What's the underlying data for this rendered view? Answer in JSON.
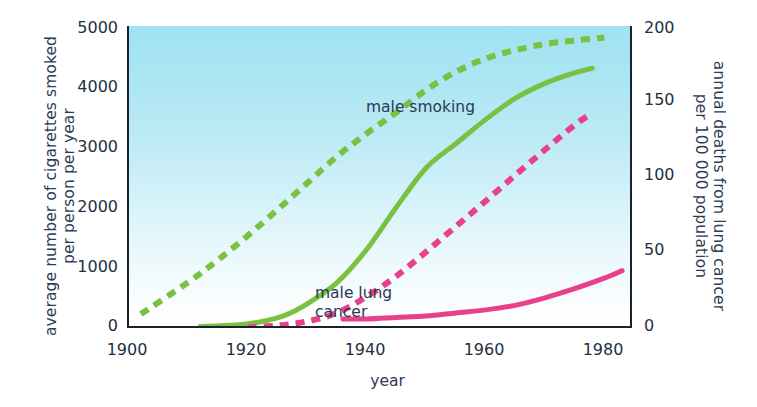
{
  "chart_data": {
    "type": "line",
    "title": "",
    "xlabel": "year",
    "ylabel_left": "average number of cigarettes smoked per person per year",
    "ylabel_right": "annual deaths from lung cancer per 100 000 population",
    "xlim": [
      1900,
      1985
    ],
    "ylim_left": [
      0,
      5000
    ],
    "ylim_right": [
      0,
      200
    ],
    "xticks": [
      "1900",
      "1920",
      "1940",
      "1960",
      "1980"
    ],
    "xtick_values": [
      1900,
      1920,
      1940,
      1960,
      1980
    ],
    "yticks_left": [
      "0",
      "1000",
      "2000",
      "3000",
      "4000",
      "5000"
    ],
    "ytick_values_left": [
      0,
      1000,
      2000,
      3000,
      4000,
      5000
    ],
    "yticks_right": [
      "0",
      "50",
      "100",
      "150",
      "200"
    ],
    "ytick_values_right": [
      0,
      50,
      100,
      150,
      200
    ],
    "grid": false,
    "legend_position": "inline-annotations",
    "series": [
      {
        "name": "male smoking",
        "axis": "left",
        "style": "dashed",
        "color": "#7ac043",
        "x": [
          1902,
          1910,
          1915,
          1920,
          1925,
          1930,
          1935,
          1940,
          1945,
          1950,
          1955,
          1960,
          1965,
          1970,
          1975,
          1980
        ],
        "values": [
          230,
          760,
          1130,
          1530,
          1960,
          2400,
          2840,
          3220,
          3570,
          3940,
          4240,
          4460,
          4600,
          4700,
          4760,
          4810
        ]
      },
      {
        "name": "male lung cancer",
        "axis": "right",
        "style": "solid",
        "color": "#7ac043",
        "x": [
          1912,
          1918,
          1922,
          1926,
          1930,
          1935,
          1940,
          1945,
          1950,
          1955,
          1960,
          1965,
          1970,
          1975,
          1978
        ],
        "values": [
          1,
          2,
          4,
          8,
          16,
          30,
          52,
          80,
          106,
          122,
          138,
          152,
          162,
          169,
          172
        ]
      },
      {
        "name": "female smoking",
        "axis": "left",
        "style": "dashed",
        "color": "#ea3f8b",
        "x": [
          1920,
          1925,
          1930,
          1935,
          1940,
          1945,
          1950,
          1955,
          1960,
          1965,
          1970,
          1975,
          1978
        ],
        "values": [
          10,
          40,
          110,
          250,
          520,
          860,
          1260,
          1680,
          2100,
          2530,
          2950,
          3360,
          3560
        ]
      },
      {
        "name": "female lung cancer",
        "axis": "right",
        "style": "solid",
        "color": "#ea3f8b",
        "x": [
          1936,
          1940,
          1945,
          1950,
          1955,
          1960,
          1965,
          1970,
          1975,
          1980,
          1983
        ],
        "values": [
          6,
          6,
          7,
          8,
          10,
          12,
          15,
          20,
          26,
          33,
          38
        ]
      }
    ],
    "annotations": [
      {
        "text_line1": "male smoking",
        "text_line2": ""
      },
      {
        "text_line1": "male lung",
        "text_line2": "cancer"
      },
      {
        "text_line1": "female",
        "text_line2": "smoking"
      },
      {
        "text_line1": "female lung",
        "text_line2": "cancer"
      }
    ],
    "colors": {
      "green": "#7ac043",
      "pink": "#ea3f8b",
      "plot_bg_top": "#9fe2f2",
      "plot_bg_bottom": "#ffffff",
      "axis": "#19232e",
      "text": "#2b3a51"
    }
  },
  "axes": {
    "left_title_line1": "average number of cigarettes smoked",
    "left_title_line2": "per person per year",
    "right_title_line1": "annual deaths from lung cancer",
    "right_title_line2": "per 100 000 population",
    "x_title": "year"
  },
  "ticks": {
    "left": [
      "5000",
      "4000",
      "3000",
      "2000",
      "1000",
      "0"
    ],
    "right": [
      "200",
      "150",
      "100",
      "50",
      "0"
    ],
    "bottom": [
      "1900",
      "1920",
      "1940",
      "1960",
      "1980"
    ]
  },
  "notes": {
    "male_smoking": "male smoking",
    "male_lung_1": "male lung",
    "male_lung_2": "cancer",
    "female_smoking_1": "female",
    "female_smoking_2": "smoking",
    "female_lung_1": "female lung",
    "female_lung_2": "cancer"
  }
}
